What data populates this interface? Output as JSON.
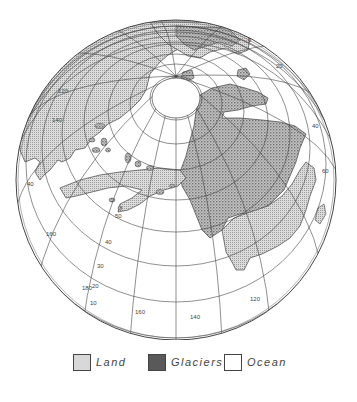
{
  "map": {
    "projection": "orthographic globe",
    "globe": {
      "cx": 176,
      "cy": 180,
      "r": 160
    },
    "pole": {
      "cx": 176,
      "cy": 98,
      "r": 26
    },
    "colors": {
      "land": "#d8d8d8",
      "glaciers": "#bdbdbd",
      "ocean": "#ffffff",
      "grid": "#444444"
    },
    "latitude_labels": [
      {
        "text": "0",
        "x": 248,
        "y": 42
      },
      {
        "text": "20",
        "x": 276,
        "y": 68
      },
      {
        "text": "40",
        "x": 312,
        "y": 128
      },
      {
        "text": "60",
        "x": 322,
        "y": 173
      },
      {
        "text": "40",
        "x": 27,
        "y": 186
      },
      {
        "text": "50",
        "x": 115,
        "y": 218
      },
      {
        "text": "40",
        "x": 105,
        "y": 244
      },
      {
        "text": "30",
        "x": 97,
        "y": 268
      },
      {
        "text": "20",
        "x": 92,
        "y": 288
      },
      {
        "text": "10",
        "x": 90,
        "y": 305
      }
    ],
    "longitude_labels": [
      {
        "text": "120",
        "x": 58,
        "y": 93
      },
      {
        "text": "140",
        "x": 52,
        "y": 122
      },
      {
        "text": "160",
        "x": 46,
        "y": 236
      },
      {
        "text": "180",
        "x": 82,
        "y": 290
      },
      {
        "text": "160",
        "x": 135,
        "y": 314
      },
      {
        "text": "140",
        "x": 190,
        "y": 319
      },
      {
        "text": "120",
        "x": 250,
        "y": 301
      }
    ]
  },
  "legend": {
    "items": [
      {
        "key": "land",
        "label": "Land"
      },
      {
        "key": "glaciers",
        "label": "Glaciers"
      },
      {
        "key": "ocean",
        "label": "Ocean"
      }
    ]
  }
}
